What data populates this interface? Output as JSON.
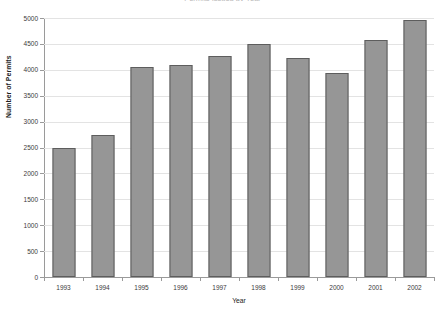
{
  "chart_data": {
    "type": "bar",
    "title": "Permits Issued by Year",
    "xlabel": "Year",
    "ylabel": "Number of Permits",
    "categories": [
      "1993",
      "1994",
      "1995",
      "1996",
      "1997",
      "1998",
      "1999",
      "2000",
      "2001",
      "2002"
    ],
    "values": [
      2500,
      2750,
      4050,
      4100,
      4270,
      4500,
      4220,
      3930,
      4580,
      4960
    ],
    "series": [
      {
        "name": "Number of Permits",
        "values": [
          2500,
          2750,
          4050,
          4100,
          4270,
          4500,
          4220,
          3930,
          4580,
          4960
        ]
      }
    ],
    "ylim": [
      0,
      5000
    ],
    "yticks": [
      0,
      500,
      1000,
      1500,
      2000,
      2500,
      3000,
      3500,
      4000,
      4500,
      5000
    ],
    "ytick_labels": [
      "0",
      "500",
      "1000",
      "1500",
      "2000",
      "2500",
      "3000",
      "3500",
      "4000",
      "4500",
      "5000"
    ],
    "grid": true,
    "legend": false,
    "legend_position": "none",
    "bar_color": "#969696",
    "bar_border_color": "#5d5d5d",
    "gridline_color": "#e3e3e3",
    "axis_color": "#9a9a9a",
    "background_color": "#ffffff"
  }
}
